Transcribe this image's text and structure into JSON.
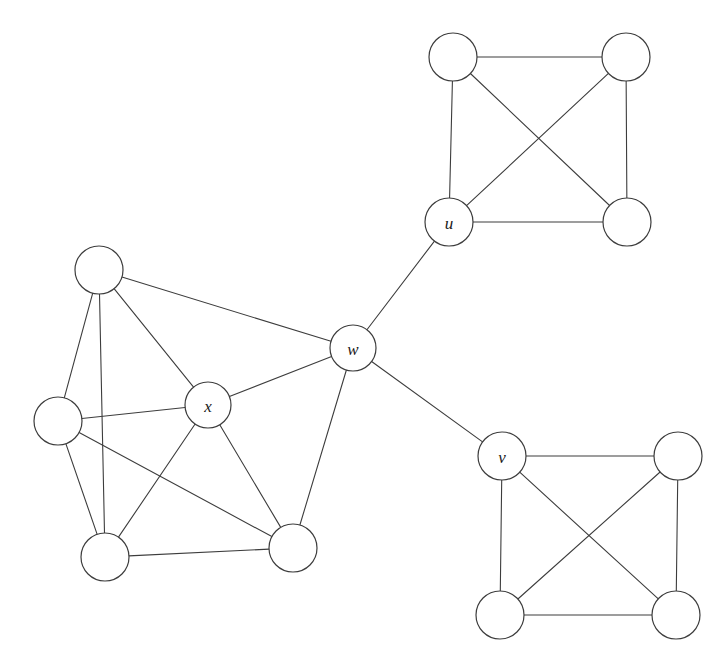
{
  "figure": {
    "width": 727,
    "height": 668,
    "background_color": "#ffffff",
    "stroke_color": "#3d3d3d",
    "node_fill_color": "#ffffff",
    "label_color": "#1a1a1a"
  },
  "chart_data": {
    "type": "diagram",
    "diagram_type": "undirected-graph",
    "title": "",
    "node_radius_default": 24,
    "nodes": [
      {
        "id": "p1",
        "label": "",
        "cx": 99,
        "cy": 270,
        "r": 24,
        "cluster": "left"
      },
      {
        "id": "p2",
        "label": "",
        "cx": 58,
        "cy": 421,
        "r": 24,
        "cluster": "left"
      },
      {
        "id": "x",
        "label": "x",
        "cx": 208,
        "cy": 405,
        "r": 23,
        "cluster": "left"
      },
      {
        "id": "p3",
        "label": "",
        "cx": 105,
        "cy": 557,
        "r": 24,
        "cluster": "left"
      },
      {
        "id": "p4",
        "label": "",
        "cx": 293,
        "cy": 548,
        "r": 24,
        "cluster": "left"
      },
      {
        "id": "w",
        "label": "w",
        "cx": 353,
        "cy": 348,
        "r": 23,
        "cluster": "bridge"
      },
      {
        "id": "u",
        "label": "u",
        "cx": 449,
        "cy": 222,
        "r": 24,
        "cluster": "top-right"
      },
      {
        "id": "t1",
        "label": "",
        "cx": 453,
        "cy": 57,
        "r": 24,
        "cluster": "top-right"
      },
      {
        "id": "t2",
        "label": "",
        "cx": 626,
        "cy": 57,
        "r": 24,
        "cluster": "top-right"
      },
      {
        "id": "t3",
        "label": "",
        "cx": 627,
        "cy": 222,
        "r": 24,
        "cluster": "top-right"
      },
      {
        "id": "v",
        "label": "v",
        "cx": 502,
        "cy": 456,
        "r": 24,
        "cluster": "bottom-right"
      },
      {
        "id": "b1",
        "label": "",
        "cx": 678,
        "cy": 456,
        "r": 24,
        "cluster": "bottom-right"
      },
      {
        "id": "b2",
        "label": "",
        "cx": 500,
        "cy": 615,
        "r": 24,
        "cluster": "bottom-right"
      },
      {
        "id": "b3",
        "label": "",
        "cx": 676,
        "cy": 615,
        "r": 24,
        "cluster": "bottom-right"
      }
    ],
    "edges": [
      {
        "source": "p1",
        "target": "p2"
      },
      {
        "source": "p1",
        "target": "p3"
      },
      {
        "source": "p1",
        "target": "x"
      },
      {
        "source": "p1",
        "target": "w"
      },
      {
        "source": "p2",
        "target": "x"
      },
      {
        "source": "p2",
        "target": "p3"
      },
      {
        "source": "p2",
        "target": "p4"
      },
      {
        "source": "x",
        "target": "p3"
      },
      {
        "source": "x",
        "target": "p4"
      },
      {
        "source": "x",
        "target": "w"
      },
      {
        "source": "p3",
        "target": "p4"
      },
      {
        "source": "p4",
        "target": "w"
      },
      {
        "source": "w",
        "target": "u"
      },
      {
        "source": "w",
        "target": "v"
      },
      {
        "source": "u",
        "target": "t1"
      },
      {
        "source": "u",
        "target": "t2"
      },
      {
        "source": "u",
        "target": "t3"
      },
      {
        "source": "t1",
        "target": "t2"
      },
      {
        "source": "t1",
        "target": "t3"
      },
      {
        "source": "t2",
        "target": "t3"
      },
      {
        "source": "v",
        "target": "b1"
      },
      {
        "source": "v",
        "target": "b2"
      },
      {
        "source": "v",
        "target": "b3"
      },
      {
        "source": "b1",
        "target": "b2"
      },
      {
        "source": "b1",
        "target": "b3"
      },
      {
        "source": "b2",
        "target": "b3"
      }
    ],
    "clusters": [
      {
        "name": "left",
        "description": "six-node dense block containing x",
        "node_count": 6
      },
      {
        "name": "top-right",
        "description": "complete graph K4 containing u",
        "node_count": 4
      },
      {
        "name": "bottom-right",
        "description": "complete graph K4 containing v",
        "node_count": 4
      }
    ],
    "labeled_nodes": [
      "u",
      "v",
      "w",
      "x"
    ]
  }
}
